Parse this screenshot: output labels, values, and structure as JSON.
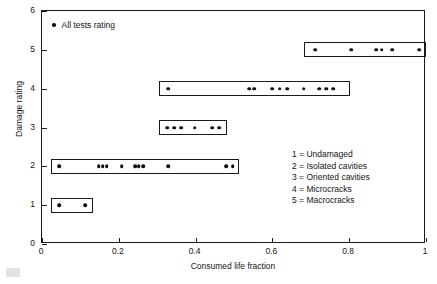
{
  "chart_data": {
    "type": "scatter",
    "title": "",
    "xlabel": "Consumed life fraction",
    "ylabel": "Damage rating",
    "xlim": [
      0,
      1
    ],
    "ylim": [
      0,
      6
    ],
    "xticks": [
      0,
      0.2,
      0.4,
      0.6,
      0.8,
      1
    ],
    "xtick_labels": [
      "0",
      "0.2",
      "0.4",
      "0.6",
      "0.8",
      "1"
    ],
    "yticks": [
      0,
      1,
      2,
      3,
      4,
      5,
      6
    ],
    "ytick_labels": [
      "0",
      "1",
      "2",
      "3",
      "4",
      "5",
      "6"
    ],
    "grid": false,
    "legend_position": "upper-left",
    "series": [
      {
        "name": "All tests rating",
        "marker": "filled-circle",
        "color": "#101010",
        "points": [
          {
            "x": 0.045,
            "y": 1
          },
          {
            "x": 0.113,
            "y": 1
          },
          {
            "x": 0.045,
            "y": 2
          },
          {
            "x": 0.148,
            "y": 2
          },
          {
            "x": 0.158,
            "y": 2
          },
          {
            "x": 0.168,
            "y": 2
          },
          {
            "x": 0.208,
            "y": 2
          },
          {
            "x": 0.242,
            "y": 2
          },
          {
            "x": 0.252,
            "y": 2
          },
          {
            "x": 0.263,
            "y": 2
          },
          {
            "x": 0.328,
            "y": 2
          },
          {
            "x": 0.479,
            "y": 2
          },
          {
            "x": 0.497,
            "y": 2
          },
          {
            "x": 0.326,
            "y": 3
          },
          {
            "x": 0.344,
            "y": 3
          },
          {
            "x": 0.362,
            "y": 3
          },
          {
            "x": 0.398,
            "y": 3
          },
          {
            "x": 0.443,
            "y": 3
          },
          {
            "x": 0.461,
            "y": 3
          },
          {
            "x": 0.328,
            "y": 4
          },
          {
            "x": 0.539,
            "y": 4
          },
          {
            "x": 0.552,
            "y": 4
          },
          {
            "x": 0.6,
            "y": 4
          },
          {
            "x": 0.619,
            "y": 4
          },
          {
            "x": 0.638,
            "y": 4
          },
          {
            "x": 0.682,
            "y": 4
          },
          {
            "x": 0.722,
            "y": 4
          },
          {
            "x": 0.74,
            "y": 4
          },
          {
            "x": 0.758,
            "y": 4
          },
          {
            "x": 0.712,
            "y": 5
          },
          {
            "x": 0.805,
            "y": 5
          },
          {
            "x": 0.87,
            "y": 5
          },
          {
            "x": 0.885,
            "y": 5
          },
          {
            "x": 0.912,
            "y": 5
          },
          {
            "x": 0.982,
            "y": 5
          }
        ]
      }
    ],
    "group_boxes": [
      {
        "rating": 1,
        "x_start": 0.023,
        "x_end": 0.133
      },
      {
        "rating": 2,
        "x_start": 0.023,
        "x_end": 0.513
      },
      {
        "rating": 3,
        "x_start": 0.305,
        "x_end": 0.482
      },
      {
        "rating": 4,
        "x_start": 0.305,
        "x_end": 0.802
      },
      {
        "rating": 5,
        "x_start": 0.682,
        "x_end": 1.0
      }
    ],
    "annotations": [
      "1 = Undamaged",
      "2 = Isolated cavities",
      "3 = Oriented cavities",
      "4 = Microcracks",
      "5 = Macrocracks"
    ]
  },
  "series_legend": {
    "label": "All tests rating",
    "marker_name": "filled-circle-marker"
  },
  "rating_key": {
    "rows": [
      "1 = Undamaged",
      "2 = Isolated cavities",
      "3 = Oriented cavities",
      "4 = Microcracks",
      "5 = Macrocracks"
    ]
  },
  "axes": {
    "x_title": "Consumed life fraction",
    "y_title": "Damage rating"
  },
  "colors": {
    "marker": "#101010",
    "frame": "#1a1a1a",
    "text": "#141414",
    "background": "#ffffff"
  }
}
